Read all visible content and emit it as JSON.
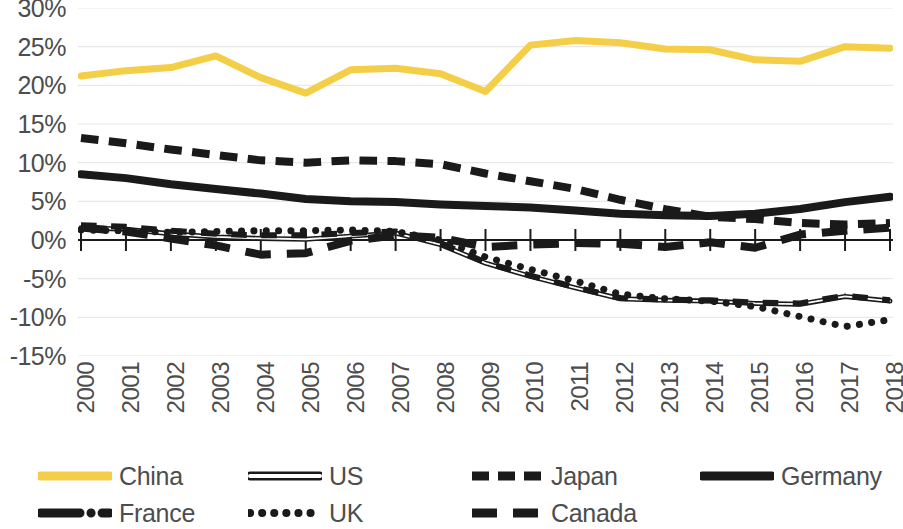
{
  "chart_data": {
    "type": "line",
    "title": "",
    "xlabel": "",
    "ylabel": "",
    "categories": [
      "2000",
      "2001",
      "2002",
      "2003",
      "2004",
      "2005",
      "2006",
      "2007",
      "2008",
      "2009",
      "2010",
      "2011",
      "2012",
      "2013",
      "2014",
      "2015",
      "2016",
      "2017",
      "2018"
    ],
    "x": [
      2000,
      2001,
      2002,
      2003,
      2004,
      2005,
      2006,
      2007,
      2008,
      2009,
      2010,
      2011,
      2012,
      2013,
      2014,
      2015,
      2016,
      2017,
      2018
    ],
    "ylim": [
      -15,
      30
    ],
    "ytick_labels": [
      "30%",
      "25%",
      "20%",
      "15%",
      "10%",
      "5%",
      "0%",
      "-5%",
      "-10%",
      "-15%"
    ],
    "ytick_values": [
      30,
      25,
      20,
      15,
      10,
      5,
      0,
      -5,
      -10,
      -15
    ],
    "grid": true,
    "legend_position": "bottom",
    "series": [
      {
        "name": "China",
        "color": "#F5CE47",
        "style": "solid",
        "width": 7,
        "values": [
          21.2,
          21.9,
          22.3,
          23.8,
          21.0,
          19.0,
          22.0,
          22.2,
          21.5,
          19.2,
          25.2,
          25.8,
          25.5,
          24.7,
          24.6,
          23.3,
          23.1,
          25.0,
          24.8
        ]
      },
      {
        "name": "US",
        "color": "#1a1a1a",
        "style": "double",
        "width": 5,
        "values": [
          1.6,
          1.4,
          0.8,
          0.4,
          0.2,
          0.1,
          0.5,
          0.9,
          -0.6,
          -3.0,
          -4.7,
          -6.2,
          -7.6,
          -7.8,
          -7.9,
          -8.2,
          -8.3,
          -7.3,
          -7.9
        ]
      },
      {
        "name": "Japan",
        "color": "#1a1a1a",
        "style": "dashed",
        "width": 8,
        "values": [
          13.2,
          12.5,
          11.7,
          11.0,
          10.3,
          10.0,
          10.3,
          10.2,
          9.8,
          8.6,
          7.6,
          6.6,
          5.2,
          4.0,
          3.0,
          2.7,
          2.2,
          2.0,
          2.2
        ]
      },
      {
        "name": "Germany",
        "color": "#1a1a1a",
        "style": "solid",
        "width": 8,
        "values": [
          8.5,
          8.0,
          7.2,
          6.6,
          6.0,
          5.3,
          5.0,
          4.9,
          4.6,
          4.4,
          4.2,
          3.8,
          3.4,
          3.2,
          3.1,
          3.4,
          4.0,
          4.9,
          5.6
        ]
      },
      {
        "name": "France",
        "color": "#1a1a1a",
        "style": "dashdot",
        "width": 6,
        "values": [
          1.9,
          1.7,
          1.2,
          0.8,
          0.6,
          0.6,
          0.9,
          1.1,
          -0.4,
          -2.9,
          -4.6,
          -6.1,
          -7.5,
          -7.7,
          -7.8,
          -8.1,
          -8.2,
          -7.2,
          -7.8
        ]
      },
      {
        "name": "UK",
        "color": "#1a1a1a",
        "style": "dotted",
        "width": 7,
        "values": [
          1.3,
          1.2,
          1.0,
          1.1,
          1.2,
          1.2,
          1.3,
          1.1,
          0.0,
          -2.2,
          -3.8,
          -5.3,
          -7.0,
          -7.6,
          -7.9,
          -8.6,
          -9.9,
          -11.2,
          -10.3
        ]
      },
      {
        "name": "Canada",
        "color": "#1a1a1a",
        "style": "longdash",
        "width": 8,
        "values": [
          1.6,
          1.1,
          0.2,
          -0.7,
          -1.9,
          -1.7,
          -0.1,
          0.6,
          0.3,
          -0.9,
          -0.6,
          -0.4,
          -0.5,
          -0.9,
          -0.3,
          -1.0,
          0.7,
          1.2,
          1.6
        ]
      }
    ]
  },
  "legend": {
    "items": [
      {
        "label": "China",
        "style": "solid",
        "color": "#F5CE47"
      },
      {
        "label": "US",
        "style": "double",
        "color": "#1a1a1a"
      },
      {
        "label": "Japan",
        "style": "dashed",
        "color": "#1a1a1a"
      },
      {
        "label": "Germany",
        "style": "solid",
        "color": "#1a1a1a"
      },
      {
        "label": "France",
        "style": "dashdot",
        "color": "#1a1a1a"
      },
      {
        "label": "UK",
        "style": "dotted",
        "color": "#1a1a1a"
      },
      {
        "label": "Canada",
        "style": "longdash",
        "color": "#1a1a1a"
      }
    ]
  }
}
